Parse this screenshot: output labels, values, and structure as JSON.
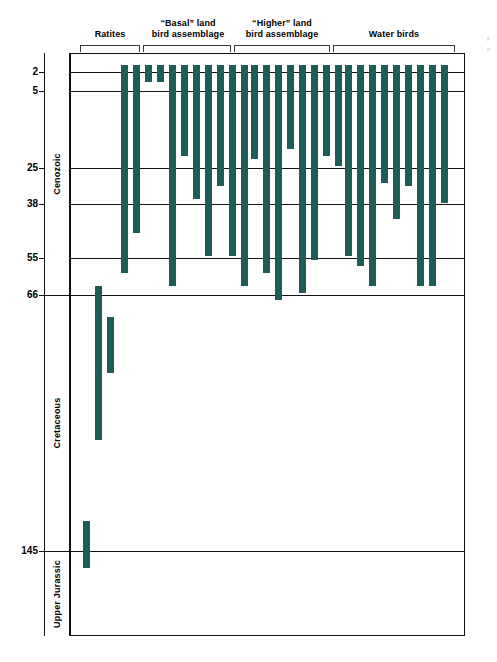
{
  "figure": {
    "bar_color": "#1d5c57",
    "axis_color": "#111111",
    "background": "#ffffff"
  },
  "groups": [
    {
      "id": "ratites",
      "label_line1": "Ratites",
      "label_line2": ""
    },
    {
      "id": "basal-land",
      "label_line1": "“Basal” land",
      "label_line2": "bird assemblage"
    },
    {
      "id": "higher-land",
      "label_line1": "“Higher” land",
      "label_line2": "bird assemblage"
    },
    {
      "id": "water-birds",
      "label_line1": "Water birds",
      "label_line2": ""
    }
  ],
  "eras": [
    {
      "id": "cenozoic",
      "label": "Cenozoic"
    },
    {
      "id": "cretaceous",
      "label": "Cretaceous"
    },
    {
      "id": "upper-jurassic",
      "label": "Upper Jurassic"
    }
  ],
  "taxa_labels": [
    {
      "id": "archaeopteryx",
      "label": "Archaeopteryx",
      "italic": true
    }
  ],
  "axis_ticks": [
    {
      "value": 2,
      "label": "2"
    },
    {
      "value": 5,
      "label": "5"
    },
    {
      "value": 25,
      "label": "25"
    },
    {
      "value": 38,
      "label": "38"
    },
    {
      "value": 55,
      "label": "55"
    },
    {
      "value": 66,
      "label": "66"
    },
    {
      "value": 145,
      "label": "145"
    }
  ],
  "edge_note": {
    "line1": "F",
    "line2": "o"
  },
  "chart_data": {
    "type": "bar",
    "orientation": "vertical-ranges",
    "xlabel": "",
    "ylabel": "Millions of years before present (Ma)",
    "ylim": [
      0,
      175
    ],
    "y_inverted": true,
    "grid": true,
    "legend": "none",
    "axis_tick_values": [
      2,
      5,
      25,
      38,
      55,
      66,
      145
    ],
    "axis_tick_labels": [
      "2",
      "5",
      "25",
      "38",
      "55",
      "66",
      "145"
    ],
    "era_bands": [
      {
        "name": "Cenozoic",
        "from": 0,
        "to": 66
      },
      {
        "name": "Cretaceous",
        "from": 66,
        "to": 145
      },
      {
        "name": "Upper Jurassic",
        "from": 145,
        "to": 175
      }
    ],
    "series_note": "Each bar is the fossil range of one bird lineage; top of bar = youngest occurrence (Ma), bottom = oldest occurrence (Ma).",
    "categories": [
      "Ratites",
      "“Basal” land bird assemblage",
      "“Higher” land bird assemblage",
      "Water birds"
    ],
    "series": [
      {
        "name": "Ratites",
        "bars": [
          {
            "x": 98,
            "top": 66,
            "bottom": 112
          },
          {
            "x": 110,
            "top": 75,
            "bottom": 92
          },
          {
            "x": 86,
            "top": 136,
            "bottom": 150
          },
          {
            "x": 124,
            "top": 0,
            "bottom": 62
          },
          {
            "x": 136,
            "top": 0,
            "bottom": 50
          }
        ]
      },
      {
        "name": "“Basal” land bird assemblage",
        "bars": [
          {
            "x": 148,
            "top": 0,
            "bottom": 5
          },
          {
            "x": 160,
            "top": 0,
            "bottom": 5
          },
          {
            "x": 172,
            "top": 0,
            "bottom": 66
          },
          {
            "x": 184,
            "top": 0,
            "bottom": 27
          },
          {
            "x": 196,
            "top": 0,
            "bottom": 40
          },
          {
            "x": 208,
            "top": 0,
            "bottom": 57
          },
          {
            "x": 220,
            "top": 0,
            "bottom": 36
          },
          {
            "x": 232,
            "top": 0,
            "bottom": 57
          },
          {
            "x": 244,
            "top": 0,
            "bottom": 66
          }
        ]
      },
      {
        "name": "“Higher” land bird assemblage",
        "bars": [
          {
            "x": 254,
            "top": 0,
            "bottom": 28
          },
          {
            "x": 266,
            "top": 0,
            "bottom": 62
          },
          {
            "x": 278,
            "top": 0,
            "bottom": 70
          },
          {
            "x": 290,
            "top": 0,
            "bottom": 25
          },
          {
            "x": 302,
            "top": 0,
            "bottom": 68
          },
          {
            "x": 314,
            "top": 0,
            "bottom": 58
          },
          {
            "x": 326,
            "top": 0,
            "bottom": 27
          },
          {
            "x": 338,
            "top": 0,
            "bottom": 30
          }
        ]
      },
      {
        "name": "Water birds",
        "bars": [
          {
            "x": 348,
            "top": 0,
            "bottom": 57
          },
          {
            "x": 360,
            "top": 0,
            "bottom": 60
          },
          {
            "x": 372,
            "top": 0,
            "bottom": 66
          },
          {
            "x": 384,
            "top": 0,
            "bottom": 35
          },
          {
            "x": 396,
            "top": 0,
            "bottom": 46
          },
          {
            "x": 408,
            "top": 0,
            "bottom": 36
          },
          {
            "x": 420,
            "top": 0,
            "bottom": 58
          },
          {
            "x": 432,
            "top": 0,
            "bottom": 66
          },
          {
            "x": 444,
            "top": 0,
            "bottom": 41
          },
          {
            "x": 372,
            "top": 44,
            "bottom": 62
          },
          {
            "x": 420,
            "top": 0,
            "bottom": 66
          }
        ]
      }
    ]
  }
}
